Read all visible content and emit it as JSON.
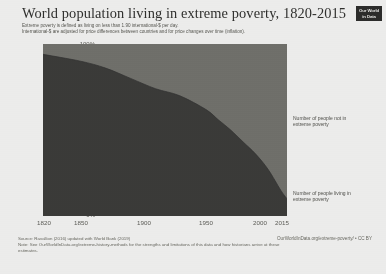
{
  "logo": {
    "line1": "Our World",
    "line2": "in Data"
  },
  "header": {
    "title": "World population living in extreme poverty, 1820-2015",
    "subtitle_1": "Extreme poverty is defined as living on less than 1.90 international-$ per day.",
    "subtitle_2": "International-$ are adjusted for price differences between countries and for price changes over time (inflation)."
  },
  "annotations": {
    "not_in_poverty": "Number of people not in extreme poverty",
    "in_poverty": "Number of people living in extreme poverty"
  },
  "footer": {
    "source": "Source: Ravallion (2016) updated with World Bank (2019)",
    "note_1": "Note: See OurWorldInData.org/extreme-history-methods for the strengths and limitations of this data and how historians arrive at these",
    "note_2": "estimates.",
    "attribution": "OurWorldInData.org/extreme-poverty/ • CC BY"
  },
  "colors": {
    "background": "#ececeb",
    "area_not_in_poverty": "#6f6f6a",
    "area_in_poverty": "#3a3a38",
    "text": "#4a4a46",
    "logo_background": "#2b2b2a"
  },
  "chart_data": {
    "type": "area",
    "title": "World population living in extreme poverty, 1820-2015",
    "xlabel": "",
    "ylabel": "",
    "stacked": true,
    "normalized_percent": true,
    "grid": false,
    "legend": "right-annotations",
    "xlim": [
      1820,
      2015
    ],
    "ylim": [
      0,
      100
    ],
    "x_ticks": [
      1820,
      1850,
      1900,
      1950,
      2000,
      2015
    ],
    "y_ticks": [
      0,
      20,
      40,
      60,
      80,
      100
    ],
    "y_tick_labels": [
      "0%",
      "20%",
      "40%",
      "60%",
      "80%",
      "100%"
    ],
    "x": [
      1820,
      1850,
      1870,
      1890,
      1910,
      1929,
      1950,
      1960,
      1970,
      1980,
      1990,
      2000,
      2010,
      2015
    ],
    "series": [
      {
        "name": "Number of people living in extreme poverty",
        "values": [
          94,
          90,
          86,
          80,
          74,
          70,
          62,
          56,
          50,
          43,
          36,
          27,
          15,
          10
        ]
      },
      {
        "name": "Number of people not in extreme poverty",
        "values": [
          6,
          10,
          14,
          20,
          26,
          30,
          38,
          44,
          50,
          57,
          64,
          73,
          85,
          90
        ]
      }
    ]
  }
}
